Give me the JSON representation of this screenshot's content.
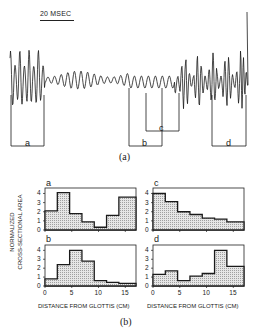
{
  "figure": {
    "scale_bar_label": "20 MSEC",
    "caption_a": "(a)",
    "caption_b": "(b)",
    "waveform_segments": [
      {
        "label": "a",
        "x_start_px": 11,
        "x_end_px": 44,
        "bracket_y_px": 146
      },
      {
        "label": "b",
        "x_start_px": 129,
        "x_end_px": 162,
        "bracket_y_px": 146
      },
      {
        "label": "c",
        "x_start_px": 146,
        "x_end_px": 179,
        "bracket_y_px": 131
      },
      {
        "label": "d",
        "x_start_px": 212,
        "x_end_px": 246,
        "bracket_y_px": 146
      }
    ]
  },
  "chart_data": [
    {
      "type": "area",
      "panel": "a",
      "title": "a",
      "xlabel": "",
      "ylabel": "NORMALIZED CROSS-SECTIONAL AREA",
      "x_edges": [
        0,
        2.3,
        4.6,
        6.9,
        9.2,
        11.5,
        13.8,
        16.1,
        17
      ],
      "values": [
        2.1,
        4.1,
        1.8,
        0.9,
        0.3,
        1.6,
        3.6,
        3.6
      ],
      "xlim": [
        0,
        17
      ],
      "ylim": [
        0,
        4.6
      ],
      "yticks": [
        0,
        1,
        2,
        3,
        4
      ]
    },
    {
      "type": "area",
      "panel": "b",
      "title": "b",
      "xlabel": "DISTANCE FROM GLOTTIS (CM)",
      "ylabel": "NORMALIZED CROSS-SECTIONAL AREA",
      "x_edges": [
        0,
        2.3,
        4.6,
        6.9,
        9.2,
        11.5,
        13.8,
        16.1,
        17
      ],
      "values": [
        0.8,
        2.4,
        4.0,
        2.8,
        0.6,
        0.4,
        0.3,
        0.3
      ],
      "xlim": [
        0,
        17
      ],
      "ylim": [
        0,
        4.6
      ],
      "yticks": [
        0,
        1,
        2,
        3,
        4
      ],
      "xticks": [
        0,
        5,
        10,
        15
      ]
    },
    {
      "type": "area",
      "panel": "c",
      "title": "c",
      "xlabel": "",
      "ylabel": "",
      "x_edges": [
        0,
        2.3,
        4.6,
        6.9,
        9.2,
        11.5,
        13.8,
        16.1,
        17
      ],
      "values": [
        4.0,
        3.1,
        2.0,
        1.7,
        1.3,
        1.2,
        0.9,
        0.9
      ],
      "xlim": [
        0,
        17
      ],
      "ylim": [
        0,
        4.6
      ],
      "yticks": [
        0,
        1,
        2,
        3,
        4
      ]
    },
    {
      "type": "area",
      "panel": "d",
      "title": "d",
      "xlabel": "DISTANCE FROM GLOTTIS (CM)",
      "ylabel": "",
      "x_edges": [
        0,
        2.3,
        4.6,
        6.9,
        9.2,
        11.5,
        13.8,
        16.1,
        17
      ],
      "values": [
        1.3,
        1.7,
        0.6,
        1.1,
        1.4,
        4.0,
        2.2,
        2.2
      ],
      "xlim": [
        0,
        17
      ],
      "ylim": [
        0,
        4.6
      ],
      "yticks": [
        0,
        1,
        2,
        3,
        4
      ],
      "xticks": [
        0,
        5,
        10,
        15
      ]
    }
  ],
  "labels": {
    "ylabel_line1": "NORMALIZED",
    "ylabel_line2": "CROSS-SECTIONAL AREA",
    "xlabel": "DISTANCE  FROM GLOTTIS (CM)",
    "panel_a": "a",
    "panel_b": "b",
    "panel_c": "c",
    "panel_d": "d",
    "seg_a": "a",
    "seg_b": "b",
    "seg_c": "c",
    "seg_d": "d",
    "yticks": [
      "0",
      "1",
      "2",
      "3",
      "4"
    ],
    "xticks": [
      "0",
      "5",
      "10",
      "15"
    ]
  }
}
